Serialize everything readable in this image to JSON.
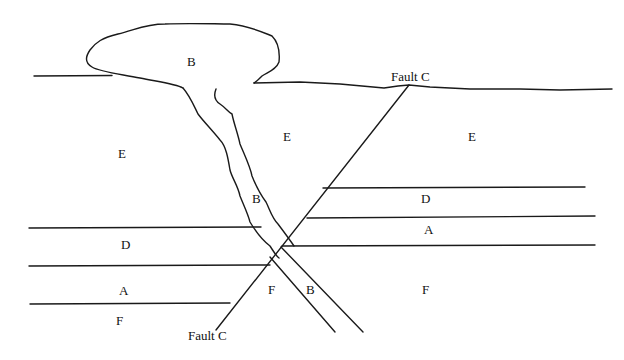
{
  "diagram": {
    "type": "geologic-cross-section",
    "labels": {
      "sill_top": "B",
      "e_left": "E",
      "e_middle": "E",
      "e_right": "E",
      "dike_upper": "B",
      "d_left": "D",
      "d_right": "D",
      "a_left": "A",
      "a_right": "A",
      "f_left": "F",
      "f_middle": "F",
      "f_right": "F",
      "dike_lower": "B",
      "fault_top": "Fault C",
      "fault_bottom": "Fault C"
    },
    "units": {
      "A": "sedimentary layer A",
      "B": "intrusion B (laccolith and dike)",
      "C": "Fault C",
      "D": "sedimentary layer D",
      "E": "layer E",
      "F": "layer F"
    },
    "colors": {
      "stroke": "#1a1a1a",
      "background": "#ffffff"
    }
  }
}
